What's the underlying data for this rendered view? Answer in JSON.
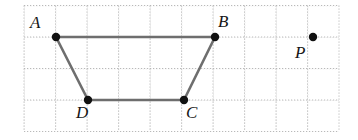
{
  "figure": {
    "background_color": "#ffffff",
    "segment_color": "#6e6e6e",
    "vertex_color": "#111111",
    "label_color": "#161616",
    "grid": {
      "minor_color": "#c9c9c9",
      "major_color": "#b4b4b4",
      "spacing_px": 31.5,
      "origin_x": 24,
      "origin_y": 5.5,
      "cols": 10,
      "rows": 4,
      "style": "dotted",
      "visible": true
    }
  },
  "points": [
    {
      "id": "A",
      "label": "A",
      "x": 56,
      "y": 37,
      "label_x": 30,
      "label_y": 14,
      "radius": 4.2
    },
    {
      "id": "B",
      "label": "B",
      "x": 215,
      "y": 37,
      "label_x": 218,
      "label_y": 13,
      "radius": 4.2
    },
    {
      "id": "C",
      "label": "C",
      "x": 184,
      "y": 100,
      "label_x": 186,
      "label_y": 104,
      "radius": 4.2
    },
    {
      "id": "D",
      "label": "D",
      "x": 88,
      "y": 100,
      "label_x": 76,
      "label_y": 104,
      "radius": 4.2
    },
    {
      "id": "P",
      "label": "P",
      "x": 313,
      "y": 37,
      "label_x": 295,
      "label_y": 44,
      "radius": 4.2
    }
  ],
  "segments": [
    {
      "name": "AB",
      "from": "A",
      "to": "B",
      "x1": 56,
      "y1": 37,
      "x2": 215,
      "y2": 37
    },
    {
      "name": "BC",
      "from": "B",
      "to": "C",
      "x1": 215,
      "y1": 37,
      "x2": 184,
      "y2": 100
    },
    {
      "name": "CD",
      "from": "C",
      "to": "D",
      "x1": 184,
      "y1": 100,
      "x2": 88,
      "y2": 100
    },
    {
      "name": "DA",
      "from": "D",
      "to": "A",
      "x1": 88,
      "y1": 100,
      "x2": 56,
      "y2": 37
    }
  ],
  "stroke_width": 2.6
}
